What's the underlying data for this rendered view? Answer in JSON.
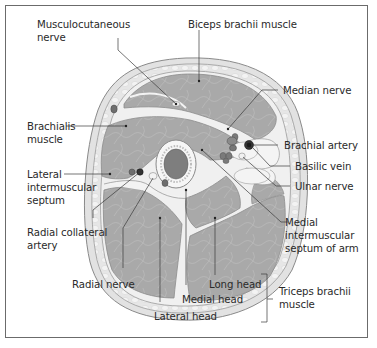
{
  "diagram": {
    "colors": {
      "frame": "#6b6b6b",
      "skin": "#ebebeb",
      "subcutaneous": "#dcdcdc",
      "muscle": "#a9a9a9",
      "fascia": "#f2f2f2",
      "bone_cortex": "#f4f4f4",
      "marrow": "#7e7e7e",
      "vessel": "#6e6e6e",
      "leader_line": "#3a3a3a",
      "text": "#2a2a2a"
    },
    "labels": {
      "musculocutaneous_nerve": "Musculocutaneous\nnerve",
      "biceps_brachii_muscle": "Biceps brachii muscle",
      "median_nerve": "Median nerve",
      "brachialis_muscle": "Brachialis\nmuscle",
      "brachial_artery": "Brachial artery",
      "basilic_vein": "Basilic vein",
      "ulnar_nerve": "Ulnar nerve",
      "lateral_intermuscular_septum": "Lateral\nintermuscular\nseptum",
      "medial_intermuscular_septum": "Medial\nintermuscular\nseptum of arm",
      "radial_collateral_artery": "Radial collateral\nartery",
      "radial_nerve": "Radial nerve",
      "long_head": "Long head",
      "medial_head": "Medial head",
      "lateral_head": "Lateral head",
      "triceps_brachii_muscle": "Triceps brachii\nmuscle"
    }
  }
}
